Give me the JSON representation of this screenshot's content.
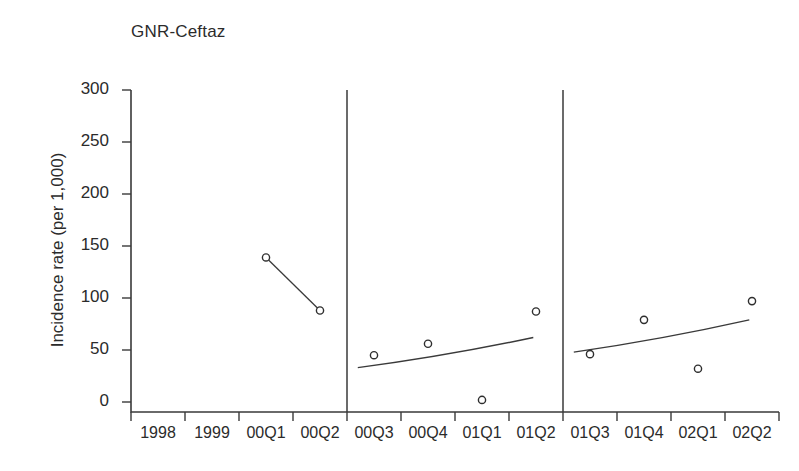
{
  "chart_data": {
    "type": "scatter",
    "title": "GNR-Ceftaz",
    "xlabel": "",
    "ylabel": "Incidence rate (per 1,000)",
    "ylim": [
      0,
      300
    ],
    "yticks": [
      0,
      50,
      100,
      150,
      200,
      250,
      300
    ],
    "ytick_labels": [
      "0",
      "50",
      "100",
      "150",
      "200",
      "250",
      "300"
    ],
    "categories": [
      "1998",
      "1999",
      "00Q1",
      "00Q2",
      "00Q3",
      "00Q4",
      "01Q1",
      "01Q2",
      "01Q3",
      "01Q4",
      "02Q1",
      "02Q2"
    ],
    "grid": false,
    "legend": "none",
    "series": [
      {
        "name": "Observed incidence rate",
        "x": [
          "1998",
          "1999",
          "00Q1",
          "00Q2",
          "00Q3",
          "00Q4",
          "01Q1",
          "01Q2",
          "01Q3",
          "01Q4",
          "02Q1",
          "02Q2"
        ],
        "values": [
          null,
          null,
          139,
          88,
          45,
          56,
          2,
          87,
          46,
          79,
          32,
          97
        ]
      }
    ],
    "segments": [
      {
        "name": "segment-1-connector",
        "style": "connected-line-with-markers",
        "points": [
          {
            "x": "00Q1",
            "y": 139
          },
          {
            "x": "00Q2",
            "y": 88
          }
        ]
      },
      {
        "name": "segment-2-trend",
        "style": "fitted-trend-line",
        "points": [
          {
            "x": "00Q3",
            "y": 45
          },
          {
            "x": "00Q4",
            "y": 56
          },
          {
            "x": "01Q1",
            "y": 2
          },
          {
            "x": "01Q2",
            "y": 87
          }
        ],
        "trend_start": 33,
        "trend_end": 62
      },
      {
        "name": "segment-3-trend",
        "style": "fitted-trend-line",
        "points": [
          {
            "x": "01Q3",
            "y": 46
          },
          {
            "x": "01Q4",
            "y": 79
          },
          {
            "x": "02Q1",
            "y": 32
          },
          {
            "x": "02Q2",
            "y": 97
          }
        ],
        "trend_start": 48,
        "trend_end": 79
      }
    ],
    "dividers": [
      {
        "name": "divider-after-00Q2",
        "after_category": "00Q2"
      },
      {
        "name": "divider-after-01Q2",
        "after_category": "01Q2"
      }
    ],
    "colors": {
      "axis": "#3a3a3a",
      "marker_stroke": "#2e2e2e",
      "marker_fill": "#ffffff",
      "line": "#3a3a3a",
      "text": "#2b2b2b",
      "background": "#ffffff"
    }
  }
}
